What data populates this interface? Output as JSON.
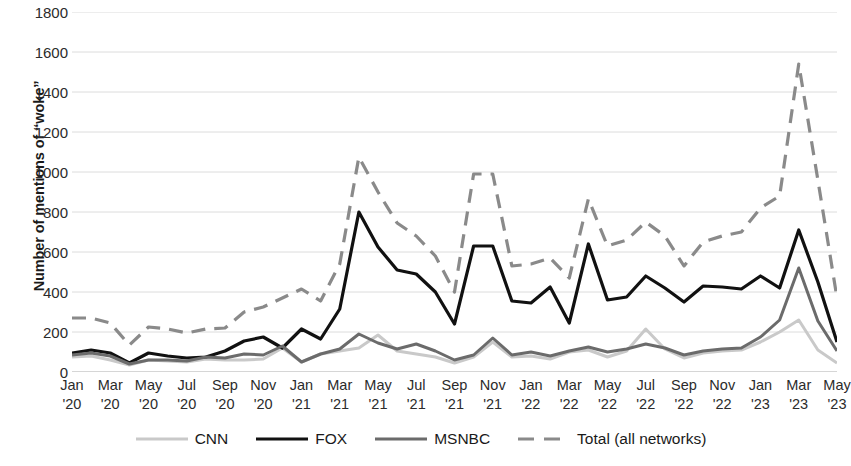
{
  "chart_data": {
    "type": "line",
    "title": "",
    "xlabel": "",
    "ylabel": "Number of mentions of “woke”",
    "ylim": [
      0,
      1800
    ],
    "ytick_step": 200,
    "yticks": [
      1800,
      1600,
      1400,
      1200,
      1000,
      800,
      600,
      400,
      200,
      0
    ],
    "grid": "horizontal",
    "legend_position": "bottom",
    "x": [
      "Jan '20",
      "Feb '20",
      "Mar '20",
      "Apr '20",
      "May '20",
      "Jun '20",
      "Jul '20",
      "Aug '20",
      "Sep '20",
      "Oct '20",
      "Nov '20",
      "Dec '20",
      "Jan '21",
      "Feb '21",
      "Mar '21",
      "Apr '21",
      "May '21",
      "Jun '21",
      "Jul '21",
      "Aug '21",
      "Sep '21",
      "Oct '21",
      "Nov '21",
      "Dec '21",
      "Jan '22",
      "Feb '22",
      "Mar '22",
      "Apr '22",
      "May '22",
      "Jun '22",
      "Jul '22",
      "Aug '22",
      "Sep '22",
      "Oct '22",
      "Nov '22",
      "Dec '22",
      "Jan '23",
      "Feb '23",
      "Mar '23",
      "Apr '23",
      "May '23"
    ],
    "xtick_labels": [
      {
        "month": "Jan",
        "year": "'20"
      },
      {
        "month": "Mar",
        "year": "'20"
      },
      {
        "month": "May",
        "year": "'20"
      },
      {
        "month": "Jul",
        "year": "'20"
      },
      {
        "month": "Sep",
        "year": "'20"
      },
      {
        "month": "Nov",
        "year": "'20"
      },
      {
        "month": "Jan",
        "year": "'21"
      },
      {
        "month": "Mar",
        "year": "'21"
      },
      {
        "month": "May",
        "year": "'21"
      },
      {
        "month": "Jul",
        "year": "'21"
      },
      {
        "month": "Sep",
        "year": "'21"
      },
      {
        "month": "Nov",
        "year": "'21"
      },
      {
        "month": "Jan",
        "year": "'22"
      },
      {
        "month": "Mar",
        "year": "'22"
      },
      {
        "month": "May",
        "year": "'22"
      },
      {
        "month": "Jul",
        "year": "'22"
      },
      {
        "month": "Sep",
        "year": "'22"
      },
      {
        "month": "Nov",
        "year": "'22"
      },
      {
        "month": "Jan",
        "year": "'23"
      },
      {
        "month": "Mar",
        "year": "'23"
      },
      {
        "month": "May",
        "year": "'23"
      }
    ],
    "series": [
      {
        "name": "CNN",
        "color": "#c9c9c9",
        "dash": "",
        "width": 3,
        "values": [
          75,
          80,
          60,
          35,
          60,
          55,
          50,
          65,
          60,
          60,
          65,
          120,
          50,
          90,
          105,
          120,
          185,
          105,
          90,
          75,
          45,
          75,
          150,
          75,
          80,
          65,
          100,
          110,
          75,
          105,
          215,
          115,
          70,
          95,
          105,
          110,
          150,
          200,
          260,
          110,
          45
        ]
      },
      {
        "name": "FOX",
        "color": "#111111",
        "dash": "",
        "width": 3.2,
        "values": [
          95,
          110,
          95,
          45,
          95,
          80,
          70,
          75,
          105,
          155,
          175,
          120,
          215,
          165,
          315,
          800,
          625,
          510,
          490,
          400,
          240,
          630,
          630,
          355,
          345,
          425,
          245,
          640,
          360,
          375,
          480,
          420,
          350,
          430,
          425,
          415,
          480,
          420,
          710,
          450,
          150
        ]
      },
      {
        "name": "MSNBC",
        "color": "#6b6b6b",
        "dash": "",
        "width": 3,
        "values": [
          85,
          95,
          80,
          40,
          60,
          60,
          55,
          75,
          70,
          90,
          85,
          130,
          50,
          90,
          115,
          190,
          145,
          115,
          140,
          105,
          60,
          85,
          170,
          85,
          100,
          80,
          105,
          125,
          100,
          115,
          140,
          120,
          85,
          105,
          115,
          120,
          175,
          260,
          520,
          255,
          105
        ]
      },
      {
        "name": "Total (all networks)",
        "color": "#8a8a8a",
        "dash": "14 9",
        "width": 3.2,
        "values": [
          270,
          270,
          245,
          135,
          225,
          215,
          195,
          215,
          220,
          300,
          325,
          370,
          415,
          355,
          540,
          1075,
          900,
          745,
          680,
          580,
          400,
          990,
          990,
          530,
          540,
          570,
          470,
          865,
          630,
          660,
          750,
          680,
          530,
          650,
          680,
          700,
          820,
          880,
          1540,
          960,
          370
        ]
      }
    ]
  },
  "legend": {
    "items": [
      {
        "label": "CNN"
      },
      {
        "label": "FOX"
      },
      {
        "label": "MSNBC"
      },
      {
        "label": "Total (all networks)"
      }
    ]
  }
}
